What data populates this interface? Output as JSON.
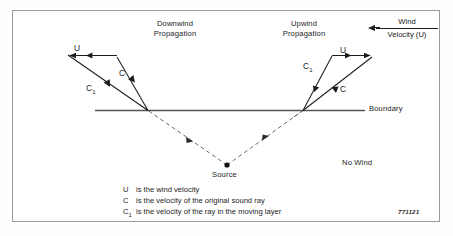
{
  "figure": {
    "code": "771121",
    "headings": {
      "downwind": "Downwind\nPropagation",
      "downwind_line1": "Downwind",
      "downwind_line2": "Propagation",
      "upwind_line1": "Upwind",
      "upwind_line2": "Propagation"
    },
    "wind_callout": {
      "top": "Wind",
      "bottom": "Velocity (U)",
      "arrow_direction": "left",
      "arrow_icon": "left-arrow-icon"
    },
    "labels": {
      "u_left": "U",
      "c_left": "C",
      "c1_left": "C",
      "c1_left_sub": "1",
      "u_right": "U",
      "c1_right": "C",
      "c1_right_sub": "1",
      "c_right": "C",
      "boundary": "Boundary",
      "source": "Source",
      "no_wind": "No Wind"
    },
    "legend": [
      {
        "symbol": "U",
        "subscript": "",
        "text": "is the wind velocity"
      },
      {
        "symbol": "C",
        "subscript": "",
        "text": "is the velocity of the original sound ray"
      },
      {
        "symbol": "C",
        "subscript": "1",
        "text": "is the velocity of the ray in the moving layer"
      }
    ],
    "colors": {
      "ink": "#1d1d1d",
      "frame": "#9a9a9a",
      "boundary_line": "#555555",
      "dashed_ray": "#6a6a6a",
      "background": "#ffffff"
    }
  }
}
